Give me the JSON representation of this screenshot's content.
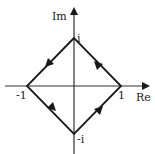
{
  "diagram": {
    "type": "complex-plane-contour",
    "axes": {
      "real_label": "Re",
      "imag_label": "Im"
    },
    "vertices": {
      "top": "i",
      "bottom": "-i",
      "left": "-1",
      "right": "1"
    },
    "orientation": "counter-clockwise",
    "colors": {
      "stroke": "#1a1a1a",
      "axis": "#333333",
      "background": "#ffffff"
    }
  }
}
